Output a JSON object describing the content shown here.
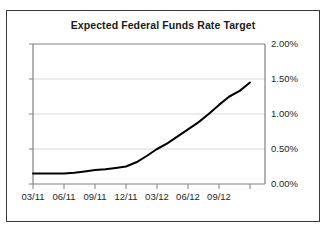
{
  "chart_data": {
    "type": "line",
    "title": "Expected Federal Funds Rate Target",
    "xlabel": "",
    "ylabel": "",
    "ylim": [
      0.0,
      2.0
    ],
    "ytick_labels": [
      "0.00%",
      "0.50%",
      "1.00%",
      "1.50%",
      "2.00%"
    ],
    "ytick_values": [
      0.0,
      0.5,
      1.0,
      1.5,
      2.0
    ],
    "ytick_position": "right",
    "xtick_labels": [
      "03/11",
      "06/11",
      "09/11",
      "12/11",
      "03/12",
      "06/12",
      "09/12"
    ],
    "grid": "horizontal",
    "legend": "none",
    "series": [
      {
        "name": "Expected Federal Funds Rate Target",
        "color": "#000000",
        "x": [
          "03/11",
          "04/11",
          "05/11",
          "06/11",
          "07/11",
          "08/11",
          "09/11",
          "10/11",
          "11/11",
          "12/11",
          "01/12",
          "02/12",
          "03/12",
          "04/12",
          "05/12",
          "06/12",
          "07/12",
          "08/12",
          "09/12",
          "10/12",
          "11/12",
          "12/12"
        ],
        "values": [
          0.15,
          0.15,
          0.15,
          0.15,
          0.16,
          0.18,
          0.2,
          0.21,
          0.23,
          0.25,
          0.31,
          0.4,
          0.5,
          0.58,
          0.68,
          0.78,
          0.88,
          1.0,
          1.13,
          1.25,
          1.33,
          1.45
        ]
      }
    ],
    "units": "percent"
  },
  "colors": {
    "series": "#000000",
    "grid": "#d9d9d9",
    "axis": "#808080",
    "frame": "#3a3a3a",
    "text": "#262626",
    "background": "#ffffff"
  }
}
